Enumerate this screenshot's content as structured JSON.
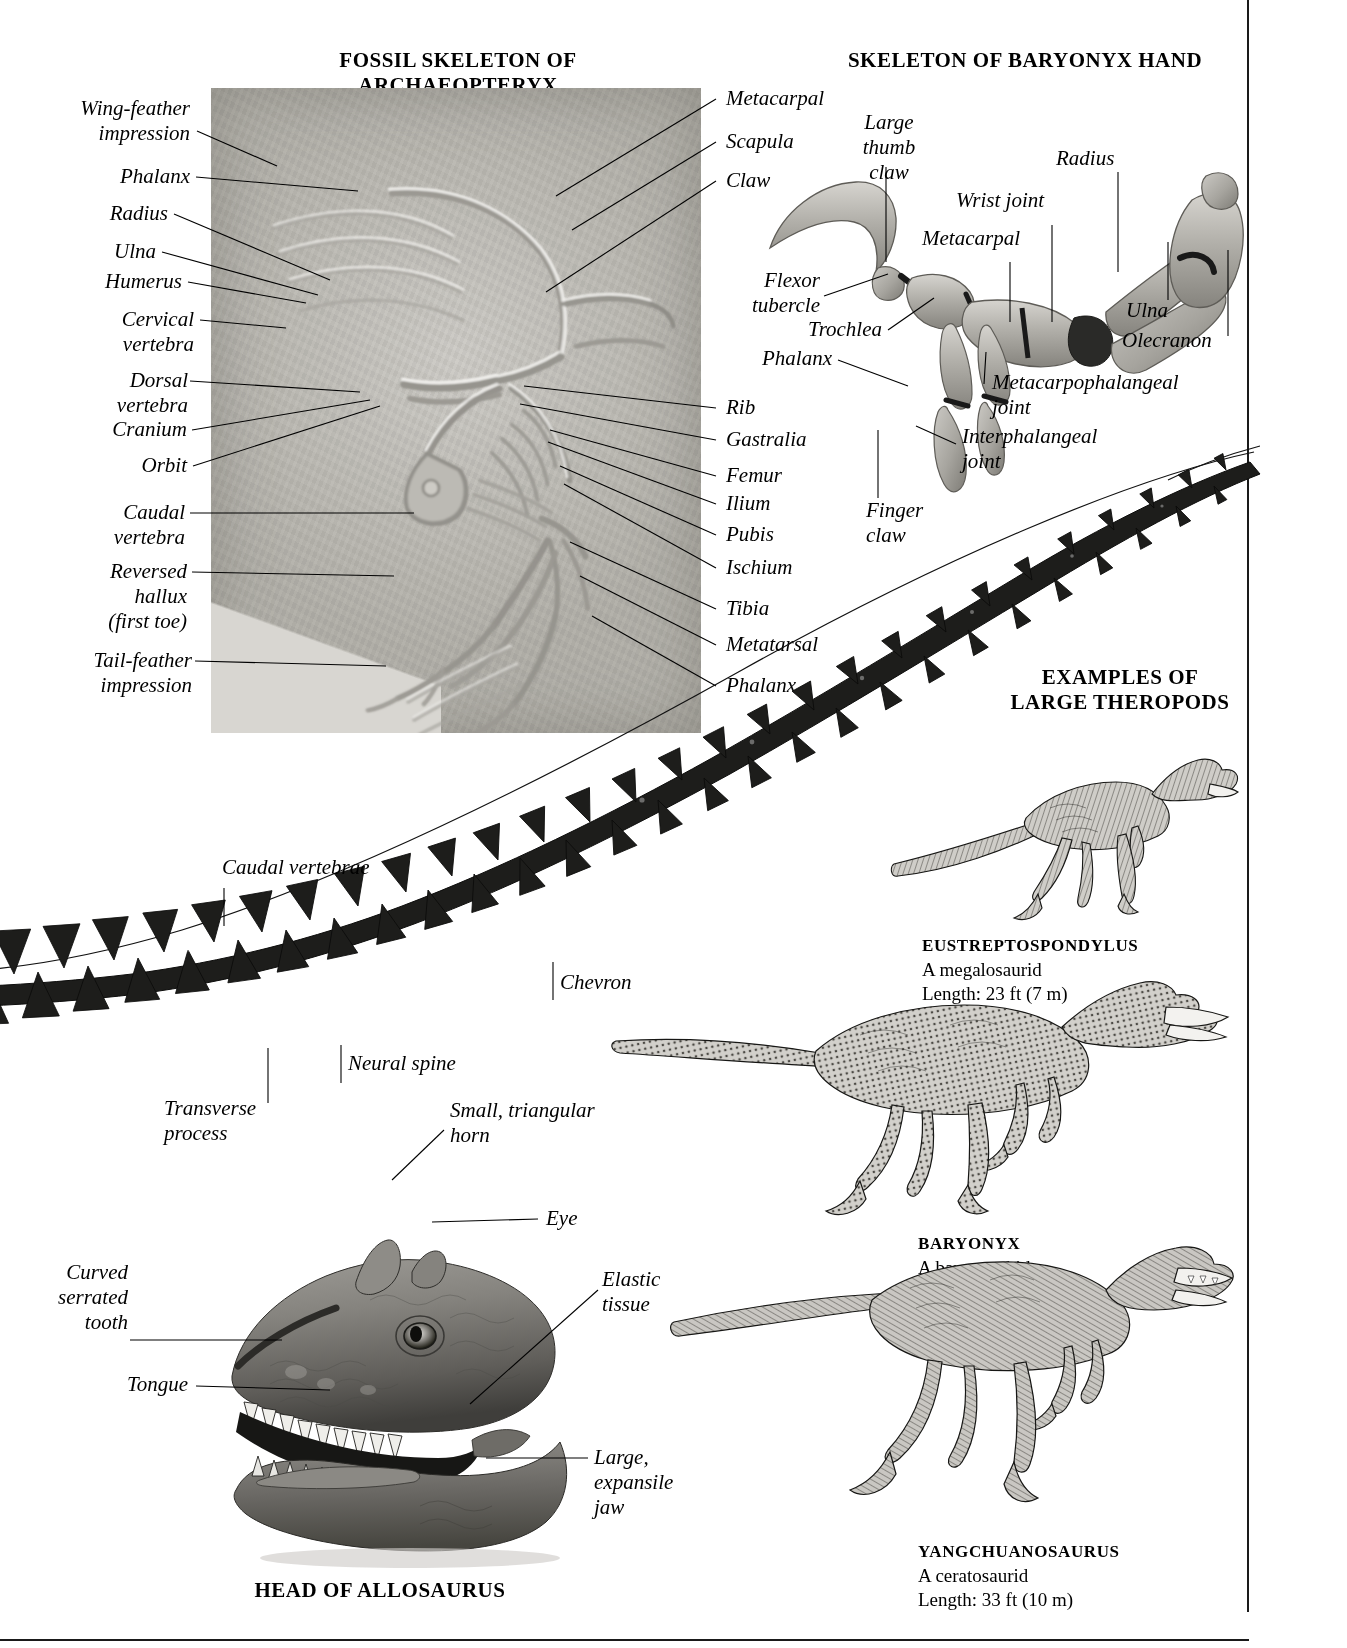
{
  "page": {
    "background": "#ffffff",
    "ink": "#000000"
  },
  "sections": {
    "archaeopteryx": {
      "title": "FOSSIL SKELETON OF ARCHAEOPTERYX",
      "left_labels": [
        "Wing-feather\nimpression",
        "Phalanx",
        "Radius",
        "Ulna",
        "Humerus",
        "Cervical\nvertebra",
        "Dorsal\nvertebra",
        "Cranium",
        "Orbit",
        "Caudal\nvertebra",
        "Reversed\nhallux\n(first toe)",
        "Tail-feather\nimpression"
      ],
      "right_labels": [
        "Metacarpal",
        "Scapula",
        "Claw",
        "Rib",
        "Gastralia",
        "Femur",
        "Ilium",
        "Pubis",
        "Ischium",
        "Tibia",
        "Metatarsal",
        "Phalanx"
      ]
    },
    "baryonyx_hand": {
      "title": "SKELETON OF BARYONYX HAND",
      "labels": [
        "Large\nthumb\nclaw",
        "Wrist joint",
        "Metacarpal",
        "Radius",
        "Ulna",
        "Olecranon",
        "Flexor\ntubercle",
        "Trochlea",
        "Phalanx",
        "Metacarpophalangeal\njoint",
        "Interphalangeal\njoint",
        "Finger\nclaw"
      ]
    },
    "tail": {
      "labels": [
        "Caudal vertebrae",
        "Chevron",
        "Neural spine",
        "Transverse\nprocess"
      ]
    },
    "allosaurus_head": {
      "title": "HEAD OF ALLOSAURUS",
      "labels": [
        "Small, triangular\nhorn",
        "Eye",
        "Elastic\ntissue",
        "Curved\nserrated\ntooth",
        "Tongue",
        "Large,\nexpansile\njaw"
      ]
    },
    "theropods": {
      "title": "EXAMPLES OF\nLARGE THEROPODS",
      "items": [
        {
          "name": "EUSTREPTOSPONDYLUS",
          "group": "A megalosaurid",
          "length": "Length: 23 ft (7 m)"
        },
        {
          "name": "BARYONYX",
          "group": "A baryonychid",
          "length": "Length: 30 ft (9.1 m)"
        },
        {
          "name": "YANGCHUANOSAURUS",
          "group": "A ceratosaurid",
          "length": "Length: 33 ft (10 m)"
        }
      ]
    }
  }
}
